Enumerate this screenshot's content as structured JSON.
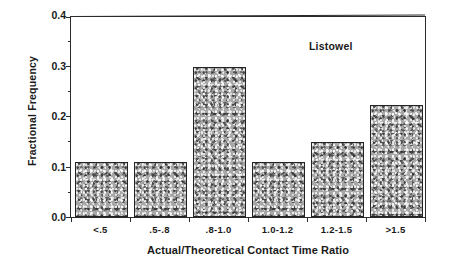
{
  "chart_data": {
    "type": "bar",
    "title": "",
    "annotation": "Listowel",
    "xlabel": "Actual/Theoretical Contact Time Ratio",
    "ylabel": "Fractional  Frequency",
    "categories": [
      "<.5",
      ".5-.8",
      ".8-1.0",
      "1.0-1.2",
      "1.2-1.5",
      ">1.5"
    ],
    "values": [
      0.11,
      0.11,
      0.3,
      0.11,
      0.15,
      0.225
    ],
    "ylim": [
      0.0,
      0.4
    ],
    "ytick_labels": [
      "0.0",
      "0.1",
      "0.2",
      "0.3",
      "0.4"
    ],
    "ytick_values": [
      0.0,
      0.1,
      0.2,
      0.3,
      0.4
    ],
    "yminor_values": [
      0.05,
      0.15,
      0.25,
      0.35
    ],
    "grid": false,
    "legend": "none",
    "bar_fill_color": "#a7a7a7",
    "bar_edge_color": "#232323",
    "axis_color": "#2b2b2b",
    "background_color": "#ffffff"
  }
}
